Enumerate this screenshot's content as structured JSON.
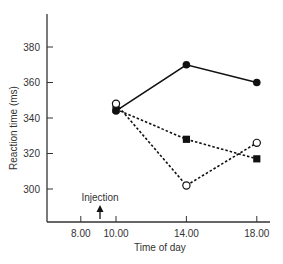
{
  "chart_data": {
    "type": "line",
    "title": "",
    "xlabel": "Time of day",
    "ylabel": "Reaction time (ms)",
    "x_ticks": [
      "8.00",
      "10.00",
      "14.00",
      "18.00"
    ],
    "y_ticks": [
      300,
      320,
      340,
      360,
      380
    ],
    "xlim": [
      6.0,
      19.0
    ],
    "ylim": [
      285,
      400
    ],
    "grid": false,
    "legend": null,
    "annotations": [
      {
        "text": "Injection",
        "x": 9.0,
        "type": "arrow-up"
      }
    ],
    "x": [
      10,
      14,
      18
    ],
    "series": [
      {
        "name": "filled-circle-solid",
        "marker": "filled-circle",
        "line": "solid",
        "values": [
          344,
          370,
          360
        ]
      },
      {
        "name": "filled-square-dashed",
        "marker": "filled-square",
        "line": "dashed",
        "values": [
          345,
          328,
          317
        ]
      },
      {
        "name": "open-circle-dashed",
        "marker": "open-circle",
        "line": "dashed",
        "values": [
          348,
          302,
          326
        ]
      }
    ]
  }
}
